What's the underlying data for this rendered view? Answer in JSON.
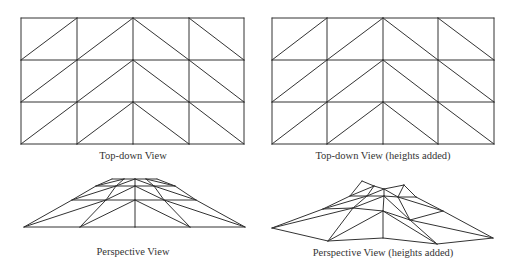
{
  "style": {
    "line_color": "#333333",
    "background": "#ffffff"
  },
  "grid_triangulation": {
    "rows": 3,
    "cols": 4,
    "diagonals_per_row": [
      "/",
      "/",
      "\\",
      "\\"
    ]
  },
  "panels": [
    {
      "id": "topdown",
      "caption": "Top-down View",
      "caption_pos": [
        133,
        150
      ],
      "vertices": [
        [
          [
            21,
            18
          ],
          [
            77,
            18
          ],
          [
            133,
            18
          ],
          [
            189,
            18
          ],
          [
            244,
            18
          ]
        ],
        [
          [
            21,
            60
          ],
          [
            77,
            60
          ],
          [
            133,
            60
          ],
          [
            189,
            60
          ],
          [
            244,
            60
          ]
        ],
        [
          [
            21,
            102
          ],
          [
            77,
            102
          ],
          [
            133,
            102
          ],
          [
            189,
            102
          ],
          [
            244,
            102
          ]
        ],
        [
          [
            21,
            144
          ],
          [
            77,
            144
          ],
          [
            133,
            144
          ],
          [
            189,
            144
          ],
          [
            244,
            144
          ]
        ]
      ]
    },
    {
      "id": "topdown-heights",
      "caption": "Top-down View (heights added)",
      "caption_pos": [
        383,
        150
      ],
      "vertices": [
        [
          [
            272,
            18
          ],
          [
            327,
            18
          ],
          [
            383,
            18
          ],
          [
            438,
            18
          ],
          [
            494,
            18
          ]
        ],
        [
          [
            272,
            60
          ],
          [
            327,
            60
          ],
          [
            383,
            60
          ],
          [
            438,
            60
          ],
          [
            494,
            60
          ]
        ],
        [
          [
            272,
            102
          ],
          [
            327,
            102
          ],
          [
            383,
            102
          ],
          [
            438,
            102
          ],
          [
            494,
            102
          ]
        ],
        [
          [
            272,
            144
          ],
          [
            327,
            144
          ],
          [
            383,
            144
          ],
          [
            438,
            144
          ],
          [
            494,
            144
          ]
        ]
      ]
    },
    {
      "id": "perspective",
      "caption": "Perspective View",
      "caption_pos": [
        133,
        246
      ],
      "vertices": [
        [
          [
            112,
            179
          ],
          [
            124,
            179
          ],
          [
            135,
            179
          ],
          [
            146,
            179
          ],
          [
            157,
            179
          ]
        ],
        [
          [
            96,
            186
          ],
          [
            116,
            186
          ],
          [
            135,
            186
          ],
          [
            154,
            186
          ],
          [
            175,
            186
          ]
        ],
        [
          [
            72,
            200
          ],
          [
            106,
            200
          ],
          [
            135,
            200
          ],
          [
            164,
            200
          ],
          [
            196,
            200
          ]
        ],
        [
          [
            24,
            227
          ],
          [
            80,
            227
          ],
          [
            135,
            227
          ],
          [
            190,
            227
          ],
          [
            245,
            227
          ]
        ]
      ]
    },
    {
      "id": "perspective-heights",
      "caption": "Perspective View (heights added)",
      "caption_pos": [
        383,
        247
      ],
      "vertices": [
        [
          [
            362,
            181
          ],
          [
            374,
            186
          ],
          [
            384,
            189
          ],
          [
            404,
            185
          ],
          [
            416,
            197
          ]
        ],
        [
          [
            350,
            196
          ],
          [
            367,
            196
          ],
          [
            384,
            196
          ],
          [
            398,
            197
          ],
          [
            416,
            197
          ]
        ],
        [
          [
            323,
            209
          ],
          [
            353,
            208
          ],
          [
            383,
            211
          ],
          [
            410,
            220
          ],
          [
            443,
            211
          ]
        ],
        [
          [
            272,
            228
          ],
          [
            328,
            241
          ],
          [
            383,
            238
          ],
          [
            437,
            244
          ],
          [
            493,
            238
          ]
        ]
      ]
    }
  ]
}
